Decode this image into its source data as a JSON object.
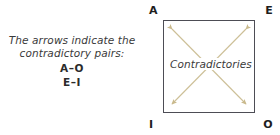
{
  "caption": {
    "line1": "The arrows indicate the",
    "line2": "contradictory pairs:",
    "pair1": "A–O",
    "pair2": "E–I"
  },
  "diagram": {
    "type": "square-of-opposition",
    "center_label": "Contradictories",
    "corners": {
      "top_left": "A",
      "top_right": "E",
      "bottom_left": "I",
      "bottom_right": "O"
    },
    "arrows": [
      {
        "name": "diagonal-a-o",
        "from": "A",
        "to": "O",
        "double_headed": true
      },
      {
        "name": "diagonal-e-i",
        "from": "E",
        "to": "I",
        "double_headed": true
      }
    ]
  },
  "colors": {
    "background": "#ffffff",
    "square_border": "#4d4d55",
    "arrow": "#c9b98c",
    "text": "#3a3a3a",
    "corner_text": "#1e1e1e"
  }
}
